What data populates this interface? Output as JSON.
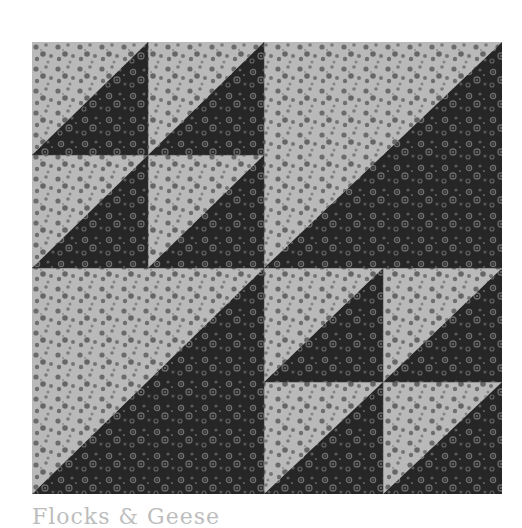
{
  "image": {
    "subject": "quilt-block-photo",
    "description": "Square quilt block made of half-square triangles in light grey and near-black floral calico",
    "colors": {
      "light_fabric": "#b9b9b9",
      "light_fabric_flower": "#6b6b6b",
      "dark_fabric": "#262626",
      "dark_fabric_flower": "#707070",
      "background": "#ffffff"
    },
    "layout": {
      "quadrants": [
        {
          "position": "top-left",
          "type": "four-small-half-square-triangles"
        },
        {
          "position": "top-right",
          "type": "one-large-half-square-triangle"
        },
        {
          "position": "bottom-left",
          "type": "one-large-half-square-triangle"
        },
        {
          "position": "bottom-right",
          "type": "four-small-half-square-triangles"
        }
      ],
      "triangle_orientation": "light upper-left, dark lower-right"
    }
  },
  "caption": {
    "text": "Flocks & Geese",
    "clipped": true
  }
}
